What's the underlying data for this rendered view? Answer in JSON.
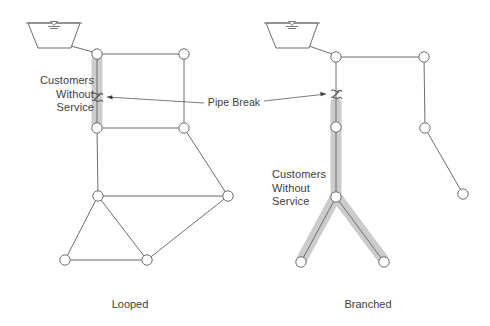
{
  "figure": {
    "background_color": "#ffffff",
    "line_color": "#6e6e6e",
    "highlight_color": "#c9c9c9",
    "text_color": "#3d3d3d"
  },
  "labels": {
    "customers_without_service_left": "Customers\nWithout\nService",
    "customers_without_service_right": "Customers\nWithout\nService",
    "pipe_break": "Pipe Break"
  },
  "captions": {
    "left": "Looped",
    "right": "Branched"
  },
  "looped": {
    "reservoir": {
      "x": 28,
      "y": 22,
      "width": 52,
      "height": 26
    },
    "nodes": [
      {
        "id": "L1",
        "x": 97,
        "y": 54
      },
      {
        "id": "L2",
        "x": 184,
        "y": 54
      },
      {
        "id": "L3",
        "x": 97,
        "y": 128
      },
      {
        "id": "L4",
        "x": 184,
        "y": 128
      },
      {
        "id": "L5",
        "x": 98,
        "y": 196
      },
      {
        "id": "L6",
        "x": 228,
        "y": 196
      },
      {
        "id": "L7",
        "x": 65,
        "y": 260
      },
      {
        "id": "L8",
        "x": 147,
        "y": 260
      }
    ],
    "pipes": [
      [
        "RES",
        "L1"
      ],
      [
        "L1",
        "L2"
      ],
      [
        "L2",
        "L4"
      ],
      [
        "L4",
        "L3"
      ],
      [
        "L3",
        "L1"
      ],
      [
        "L3",
        "L5"
      ],
      [
        "L4",
        "L6"
      ],
      [
        "L5",
        "L6"
      ],
      [
        "L5",
        "L7"
      ],
      [
        "L5",
        "L8"
      ],
      [
        "L7",
        "L8"
      ],
      [
        "L8",
        "L6"
      ]
    ],
    "break_point": {
      "x": 97,
      "y": 98
    },
    "highlight_segments": [
      {
        "x1": 97,
        "y1": 58,
        "x2": 97,
        "y2": 124
      }
    ]
  },
  "branched": {
    "reservoir": {
      "x": 266,
      "y": 22,
      "width": 52,
      "height": 26
    },
    "nodes": [
      {
        "id": "B1",
        "x": 336,
        "y": 57
      },
      {
        "id": "B2",
        "x": 424,
        "y": 57
      },
      {
        "id": "B3",
        "x": 336,
        "y": 127
      },
      {
        "id": "B4",
        "x": 425,
        "y": 128
      },
      {
        "id": "B5",
        "x": 336,
        "y": 197
      },
      {
        "id": "B6",
        "x": 463,
        "y": 194
      },
      {
        "id": "B7",
        "x": 301,
        "y": 262
      },
      {
        "id": "B8",
        "x": 384,
        "y": 262
      }
    ],
    "pipes": [
      [
        "RES",
        "B1"
      ],
      [
        "B1",
        "B2"
      ],
      [
        "B2",
        "B4"
      ],
      [
        "B4",
        "B6"
      ],
      [
        "B1",
        "B3"
      ],
      [
        "B3",
        "B5"
      ],
      [
        "B5",
        "B7"
      ],
      [
        "B5",
        "B8"
      ]
    ],
    "break_point": {
      "x": 336,
      "y": 95
    },
    "highlight_segments": [
      {
        "x1": 336,
        "y1": 101,
        "x2": 336,
        "y2": 197
      },
      {
        "x1": 336,
        "y1": 197,
        "x2": 301,
        "y2": 262
      },
      {
        "x1": 336,
        "y1": 197,
        "x2": 384,
        "y2": 262
      }
    ]
  },
  "icons": {
    "reservoir": "reservoir-tank-icon",
    "water_level": "water-level-icon",
    "junction": "junction-node-icon",
    "break": "pipe-break-squiggle-icon"
  }
}
